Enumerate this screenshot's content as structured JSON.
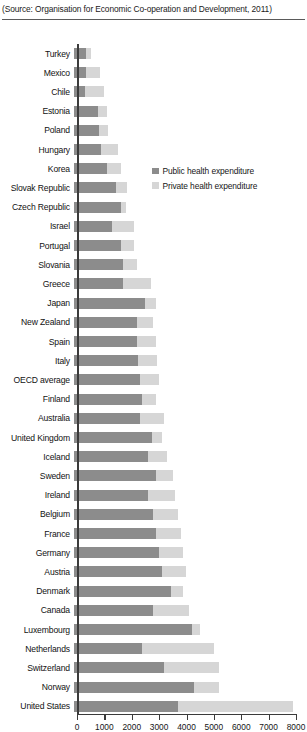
{
  "source_note": {
    "prefix": "(Source:",
    "text": " Organisation for Economic Co-operation and Development, 2011)",
    "full": "(Source: Organisation for Economic Co-operation and Development, 2011)"
  },
  "legend": {
    "position": "inside-upper-right",
    "items": [
      {
        "label": "Public health expenditure",
        "color": "#8c8c8c",
        "key": "public"
      },
      {
        "label": "Private health expenditure",
        "color": "#d6d6d6",
        "key": "private"
      }
    ]
  },
  "axis": {
    "x_ticks": [
      "0",
      "1000",
      "2000",
      "3000",
      "4000",
      "5000",
      "6000",
      "7000",
      "8000"
    ],
    "x_min": 0,
    "x_max": 8000,
    "x_step": 1000
  },
  "colors": {
    "public": "#8c8c8c",
    "private": "#d6d6d6",
    "axis": "#3b3b3b",
    "rule": "#5a5a5a",
    "background": "#ffffff",
    "text": "#161616"
  },
  "chart_data": {
    "type": "bar",
    "orientation": "horizontal",
    "stacked": true,
    "title": "",
    "subtitle": "",
    "xlabel": "",
    "ylabel": "",
    "xlim": [
      0,
      8000
    ],
    "grid": false,
    "legend_position": "inside-upper-right",
    "categories": [
      "Turkey",
      "Mexico",
      "Chile",
      "Estonia",
      "Poland",
      "Hungary",
      "Korea",
      "Slovak Republic",
      "Czech Republic",
      "Israel",
      "Portugal",
      "Slovania",
      "Greece",
      "Japan",
      "New Zealand",
      "Spain",
      "Italy",
      "OECD average",
      "Finland",
      "Australia",
      "United Kingdom",
      "Iceland",
      "Sweden",
      "Ireland",
      "Belgium",
      "France",
      "Germany",
      "Austria",
      "Denmark",
      "Canada",
      "Luxembourg",
      "Netherlands",
      "Switzerland",
      "Norway",
      "United States"
    ],
    "series": [
      {
        "name": "Public health expenditure",
        "color": "#8c8c8c",
        "values": [
          430,
          440,
          400,
          860,
          910,
          1000,
          1200,
          1550,
          1700,
          1400,
          1700,
          1800,
          1800,
          2600,
          2300,
          2300,
          2350,
          2400,
          2500,
          2400,
          2850,
          2700,
          3000,
          2700,
          2900,
          3000,
          3100,
          3200,
          3550,
          2900,
          4300,
          2500,
          3300,
          4400,
          3800
        ]
      },
      {
        "name": "Private health expenditure",
        "color": "#d6d6d6",
        "values": [
          190,
          520,
          700,
          330,
          350,
          600,
          500,
          400,
          200,
          800,
          500,
          500,
          1000,
          400,
          600,
          700,
          700,
          700,
          500,
          900,
          350,
          700,
          600,
          1000,
          900,
          900,
          900,
          900,
          450,
          1300,
          300,
          2600,
          2000,
          900,
          4200
        ]
      }
    ],
    "totals": [
      620,
      960,
      1100,
      1190,
      1260,
      1600,
      1700,
      1950,
      1900,
      2200,
      2200,
      2300,
      2800,
      3000,
      2900,
      3000,
      3050,
      3100,
      3000,
      3300,
      3200,
      3400,
      3600,
      3700,
      3800,
      3900,
      4000,
      4100,
      4000,
      4200,
      4600,
      5100,
      5300,
      5300,
      8000
    ]
  }
}
